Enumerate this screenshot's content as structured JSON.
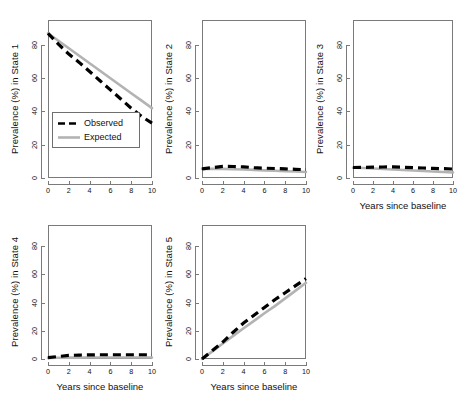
{
  "figure": {
    "legend": {
      "observed_label": "Observed",
      "expected_label": "Expected",
      "observed_color": "#000000",
      "expected_color": "#b3b3b3"
    },
    "axis": {
      "x_label": "Years since baseline",
      "x_ticks": [
        "0",
        "2",
        "4",
        "6",
        "8",
        "10"
      ],
      "y_ticks": [
        "0",
        "20",
        "40",
        "60",
        "80"
      ]
    }
  },
  "chart_data": [
    {
      "type": "line",
      "title": "",
      "panel_index": 1,
      "ylabel": "Prevalence (%) in State 1",
      "xlabel": "",
      "xlim": [
        0,
        10
      ],
      "ylim": [
        0,
        95
      ],
      "xticks": [
        0,
        2,
        4,
        6,
        8,
        10
      ],
      "yticks": [
        0,
        20,
        40,
        60,
        80
      ],
      "grid": false,
      "legend": "inside-lower-left",
      "x": [
        0,
        1,
        2,
        3,
        4,
        5,
        6,
        7,
        8,
        9,
        10
      ],
      "series": [
        {
          "name": "Observed",
          "style": "dashed",
          "color": "#000000",
          "values": [
            87,
            80.5,
            74.5,
            69.5,
            64,
            58.5,
            53,
            47.5,
            42,
            37,
            33
          ]
        },
        {
          "name": "Expected",
          "style": "solid",
          "color": "#b3b3b3",
          "values": [
            87,
            82.5,
            78,
            73.5,
            69,
            64.5,
            60,
            55.5,
            51,
            46.5,
            42
          ]
        }
      ]
    },
    {
      "type": "line",
      "title": "",
      "panel_index": 2,
      "ylabel": "Prevalence (%) in State 2",
      "xlabel": "",
      "xlim": [
        0,
        10
      ],
      "ylim": [
        0,
        95
      ],
      "xticks": [
        0,
        2,
        4,
        6,
        8,
        10
      ],
      "yticks": [
        0,
        20,
        40,
        60,
        80
      ],
      "grid": false,
      "legend": "none",
      "x": [
        0,
        1,
        2,
        3,
        4,
        5,
        6,
        7,
        8,
        9,
        10
      ],
      "series": [
        {
          "name": "Observed",
          "style": "dashed",
          "color": "#000000",
          "values": [
            5.5,
            6.2,
            7.0,
            6.9,
            6.7,
            6.2,
            5.9,
            5.7,
            5.5,
            5.2,
            5.0
          ]
        },
        {
          "name": "Expected",
          "style": "solid",
          "color": "#b3b3b3",
          "values": [
            5.5,
            5.6,
            5.5,
            5.3,
            5.1,
            4.9,
            4.6,
            4.4,
            4.1,
            3.9,
            3.6
          ]
        }
      ]
    },
    {
      "type": "line",
      "title": "",
      "panel_index": 3,
      "ylabel": "Prevalence (%) in State 3",
      "xlabel": "Years since baseline",
      "xlim": [
        0,
        10
      ],
      "ylim": [
        0,
        95
      ],
      "xticks": [
        0,
        2,
        4,
        6,
        8,
        10
      ],
      "yticks": [
        0,
        20,
        40,
        60,
        80
      ],
      "grid": false,
      "legend": "none",
      "x": [
        0,
        1,
        2,
        3,
        4,
        5,
        6,
        7,
        8,
        9,
        10
      ],
      "series": [
        {
          "name": "Observed",
          "style": "dashed",
          "color": "#000000",
          "values": [
            6.3,
            6.4,
            6.5,
            6.6,
            6.7,
            6.5,
            6.2,
            6.0,
            5.8,
            5.6,
            5.4
          ]
        },
        {
          "name": "Expected",
          "style": "solid",
          "color": "#b3b3b3",
          "values": [
            6.2,
            6.0,
            5.7,
            5.4,
            5.1,
            4.8,
            4.5,
            4.2,
            3.9,
            3.6,
            3.3
          ]
        }
      ]
    },
    {
      "type": "line",
      "title": "",
      "panel_index": 4,
      "ylabel": "Prevalence (%) in State 4",
      "xlabel": "Years since baseline",
      "xlim": [
        0,
        10
      ],
      "ylim": [
        0,
        95
      ],
      "xticks": [
        0,
        2,
        4,
        6,
        8,
        10
      ],
      "yticks": [
        0,
        20,
        40,
        60,
        80
      ],
      "grid": false,
      "legend": "none",
      "x": [
        0,
        1,
        2,
        3,
        4,
        5,
        6,
        7,
        8,
        9,
        10
      ],
      "series": [
        {
          "name": "Observed",
          "style": "dashed",
          "color": "#000000",
          "values": [
            1.0,
            1.8,
            2.5,
            2.8,
            2.9,
            3.0,
            3.0,
            3.0,
            3.0,
            3.0,
            3.0
          ]
        },
        {
          "name": "Expected",
          "style": "solid",
          "color": "#b3b3b3",
          "values": [
            0.8,
            0.9,
            1.0,
            1.0,
            1.1,
            1.1,
            1.1,
            1.1,
            1.1,
            1.1,
            1.1
          ]
        }
      ]
    },
    {
      "type": "line",
      "title": "",
      "panel_index": 5,
      "ylabel": "Prevalence (%) in State 5",
      "xlabel": "Years since baseline",
      "xlim": [
        0,
        10
      ],
      "ylim": [
        0,
        95
      ],
      "xticks": [
        0,
        2,
        4,
        6,
        8,
        10
      ],
      "yticks": [
        0,
        20,
        40,
        60,
        80
      ],
      "grid": false,
      "legend": "none",
      "x": [
        0,
        1,
        2,
        3,
        4,
        5,
        6,
        7,
        8,
        9,
        10
      ],
      "series": [
        {
          "name": "Observed",
          "style": "dashed",
          "color": "#000000",
          "values": [
            0,
            6,
            12,
            19,
            25.5,
            31,
            36.5,
            42,
            47,
            52,
            57
          ]
        },
        {
          "name": "Expected",
          "style": "solid",
          "color": "#b3b3b3",
          "values": [
            0,
            5.4,
            11,
            16.4,
            21.8,
            27,
            32.4,
            37.5,
            43,
            48.5,
            54
          ]
        }
      ]
    }
  ]
}
